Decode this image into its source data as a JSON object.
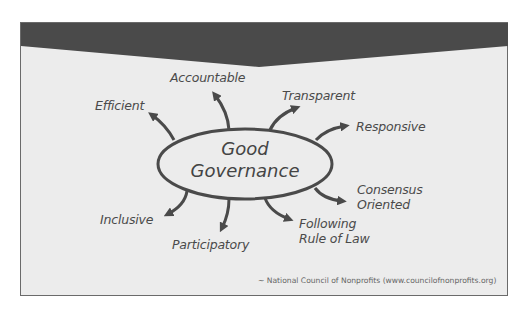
{
  "diagram": {
    "center": {
      "line1": "Good",
      "line2": "Governance"
    },
    "attributes": [
      {
        "label": "Accountable"
      },
      {
        "label": "Transparent"
      },
      {
        "label": "Responsive"
      },
      {
        "label": "Consensus",
        "label2": "Oriented"
      },
      {
        "label": "Following",
        "label2": "Rule of Law"
      },
      {
        "label": "Participatory"
      },
      {
        "label": "Inclusive"
      },
      {
        "label": "Efficient"
      }
    ],
    "source": "~ National Council of Nonprofits (www.councilofnonprofits.org)",
    "colors": {
      "banner": "#4a4a4a",
      "background": "#ececec",
      "stroke": "#4a4a4a",
      "text": "#4a4a4a"
    }
  }
}
